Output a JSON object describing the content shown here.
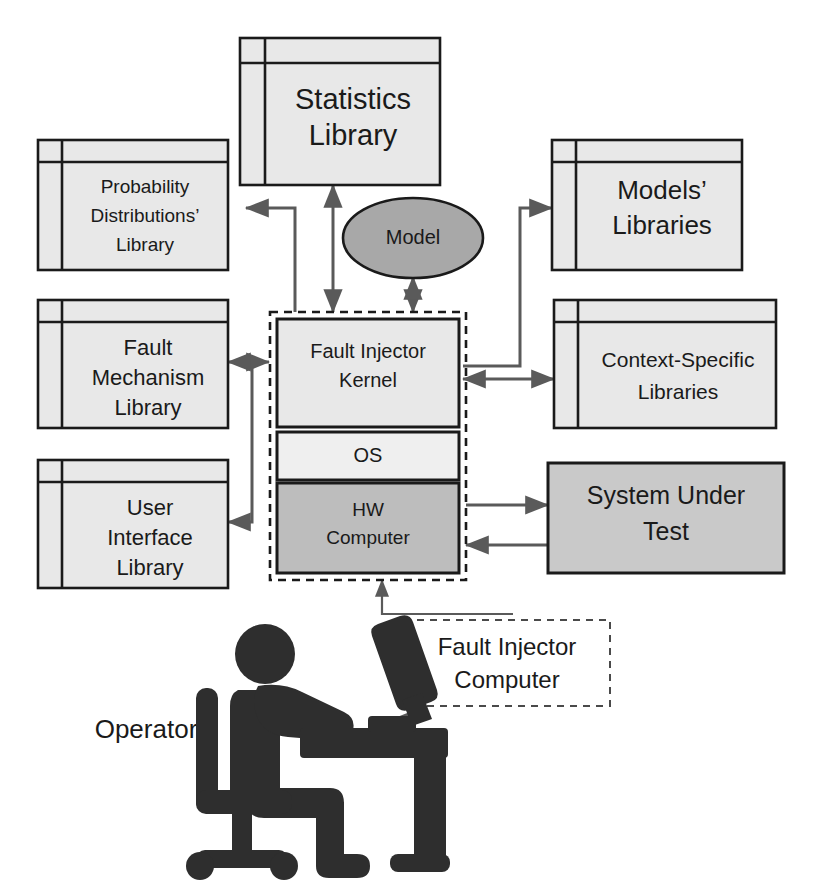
{
  "diagram": {
    "colors": {
      "library_fill": "#e8e8e8",
      "os_fill": "#efefef",
      "hardware_fill": "#bdbdbd",
      "sut_fill": "#c9c9c9",
      "model_fill": "#a8a8a8",
      "outline": "#1a1a1a",
      "connector": "#5a5a5a",
      "silhouette": "#2e2e2e"
    },
    "nodes": {
      "statistics_library": {
        "line1": "Statistics",
        "line2": "Library",
        "shape": "library"
      },
      "probability_library": {
        "line1": "Probability",
        "line2": "Distributions’",
        "line3": "Library",
        "shape": "library"
      },
      "fault_mechanism_library": {
        "line1": "Fault",
        "line2": "Mechanism",
        "line3": "Library",
        "shape": "library"
      },
      "user_interface_library": {
        "line1": "User",
        "line2": "Interface",
        "line3": "Library",
        "shape": "library"
      },
      "models_libraries": {
        "line1": "Models’",
        "line2": "Libraries",
        "shape": "library"
      },
      "context_specific_libraries": {
        "line1": "Context-Specific",
        "line2": "Libraries",
        "shape": "library"
      },
      "system_under_test": {
        "line1": "System Under",
        "line2": "Test",
        "shape": "rectangle"
      },
      "model": {
        "line1": "Model",
        "shape": "ellipse"
      },
      "fault_injector_kernel": {
        "line1": "Fault Injector",
        "line2": "Kernel",
        "shape": "rectangle"
      },
      "os": {
        "line1": "OS",
        "shape": "rectangle"
      },
      "hw_computer": {
        "line1": "HW",
        "line2": "Computer",
        "shape": "rectangle"
      },
      "fault_injector_computer": {
        "line1": "Fault Injector",
        "line2": "Computer",
        "shape": "dashed-label"
      },
      "operator": {
        "line1": "Operator",
        "shape": "text"
      }
    },
    "edges": [
      {
        "from": "fault_injector_kernel",
        "to": "statistics_library",
        "direction": "bidirectional"
      },
      {
        "from": "fault_injector_kernel",
        "to": "probability_library",
        "direction": "forward"
      },
      {
        "from": "fault_injector_kernel",
        "to": "models_libraries",
        "direction": "forward"
      },
      {
        "from": "fault_injector_kernel",
        "to": "model",
        "direction": "bidirectional"
      },
      {
        "from": "fault_injector_kernel",
        "to": "fault_mechanism_library",
        "direction": "bidirectional"
      },
      {
        "from": "fault_injector_kernel",
        "to": "user_interface_library",
        "direction": "forward"
      },
      {
        "from": "fault_injector_kernel",
        "to": "context_specific_libraries",
        "direction": "bidirectional"
      },
      {
        "from": "hw_computer",
        "to": "system_under_test",
        "direction": "forward"
      },
      {
        "from": "system_under_test",
        "to": "hw_computer",
        "direction": "forward"
      },
      {
        "from": "fault_injector_computer",
        "to": "fault_injector_stack",
        "direction": "forward"
      },
      {
        "from": "fault_injector_computer",
        "to": "operator",
        "direction": "forward"
      }
    ]
  }
}
